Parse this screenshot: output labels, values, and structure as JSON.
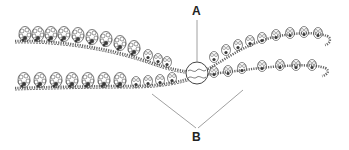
{
  "diagram": {
    "labels": [
      {
        "id": "A",
        "text": "A",
        "points_to": "circled crossover point"
      },
      {
        "id": "B",
        "text": "B",
        "points_to": "two chromatid strands"
      }
    ],
    "colors": {
      "stroke": "#555555",
      "dark_fill": "#3a3a3a",
      "leader_line": "#888888",
      "background": "#ffffff"
    }
  }
}
